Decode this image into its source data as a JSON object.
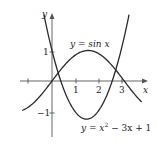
{
  "chart_data": {
    "type": "line",
    "title": "",
    "xlabel": "x",
    "ylabel": "y",
    "xlim": [
      -1.3,
      4.0
    ],
    "ylim": [
      -2.0,
      2.4
    ],
    "x_ticks": [
      1,
      2,
      3
    ],
    "x_tick_labels": [
      "1",
      "2",
      "3"
    ],
    "y_ticks": [
      1,
      -1
    ],
    "y_tick_labels": [
      "1",
      "−1"
    ],
    "grid": false,
    "series": [
      {
        "name": "y = sin x",
        "expression": "sin(x)",
        "x_range": [
          -1.3,
          3.9
        ],
        "points": [
          [
            -1.3,
            -0.96
          ],
          [
            -1,
            -0.84
          ],
          [
            0,
            0
          ],
          [
            0.5,
            0.48
          ],
          [
            1,
            0.84
          ],
          [
            1.57,
            1.0
          ],
          [
            2,
            0.91
          ],
          [
            2.5,
            0.6
          ],
          [
            3,
            0.14
          ],
          [
            3.5,
            -0.35
          ],
          [
            3.9,
            -0.69
          ]
        ]
      },
      {
        "name": "y = x² − 3x + 1",
        "expression": "x^2 - 3x + 1",
        "x_range": [
          -0.35,
          3.35
        ],
        "points": [
          [
            -0.35,
            2.17
          ],
          [
            0,
            1
          ],
          [
            0.5,
            -0.25
          ],
          [
            1,
            -1
          ],
          [
            1.5,
            -1.25
          ],
          [
            2,
            -1
          ],
          [
            2.5,
            -0.25
          ],
          [
            3,
            1
          ],
          [
            3.35,
            2.17
          ]
        ]
      }
    ],
    "annotations": [
      {
        "text": "y = sin x",
        "near": "top of sine curve"
      },
      {
        "text": "y = x² − 3x + 1",
        "near": "bottom right, below parabola"
      }
    ],
    "intersections_visible": 2
  },
  "labels": {
    "x_axis": "x",
    "y_axis": "y",
    "sin_label": "y = sin x",
    "parabola_label_prefix": "y = x",
    "parabola_label_exp": "2",
    "parabola_label_suffix": " − 3x + 1",
    "tick_x1": "1",
    "tick_x2": "2",
    "tick_x3": "3",
    "tick_y1": "1",
    "tick_ym1": "−1"
  },
  "colors": {
    "curve": "#2a2a2a",
    "axis": "#555555",
    "background": "#ffffff"
  }
}
